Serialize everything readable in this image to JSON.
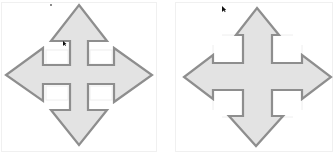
{
  "figure": {
    "items": [
      {
        "id": "left",
        "label": "Four-way arrow (diamond style, short shafts)",
        "fill": "#e3e3e3",
        "stroke": "#8e8e8e"
      },
      {
        "id": "right",
        "label": "Four-way arrow (cross style, long shafts)",
        "fill": "#e3e3e3",
        "stroke": "#8e8e8e"
      }
    ],
    "cursor": {
      "icon": "mouse-pointer-icon",
      "color": "#111111"
    }
  }
}
